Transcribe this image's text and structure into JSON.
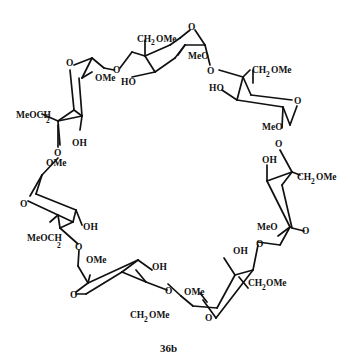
{
  "figure": {
    "caption": "36b"
  },
  "labels": {
    "unit1": {
      "ring_o": "O",
      "link_o": "O",
      "sub1": "OMe",
      "sub2_main": "MeOCH",
      "sub2_sub": "2",
      "oh": "OH"
    },
    "unit2": {
      "ring_o": "O",
      "link_o": "O",
      "ch2": "CH",
      "ch2_sub": "2",
      "ome": "OMe",
      "ho": "HO"
    },
    "unit3": {
      "ring_o": "O",
      "link_o": "O",
      "meo": "MeO",
      "ch2": "CH",
      "ch2_sub": "2",
      "ome": "OMe",
      "ho": "HO"
    },
    "unit4": {
      "ring_o": "O",
      "link_o": "O",
      "meo": "MeO",
      "oh": "OH",
      "ch2": "CH",
      "ch2_sub": "2",
      "ome": "OMe"
    },
    "unit5": {
      "ring_o": "O",
      "link_o": "O",
      "meo": "MeO",
      "oh": "OH",
      "ch2": "CH",
      "ch2_sub": "2",
      "ome": "OMe"
    },
    "unit6": {
      "ring_o": "O",
      "link_o": "O",
      "ome_top": "OMe",
      "oh": "OH",
      "ch2": "CH",
      "ch2_sub": "2",
      "ome": "OMe"
    },
    "unit7": {
      "ring_o": "O",
      "link_o": "O",
      "ome_top": "OMe",
      "sub_main": "MeOCH",
      "sub_sub": "2",
      "oh": "OH"
    }
  }
}
